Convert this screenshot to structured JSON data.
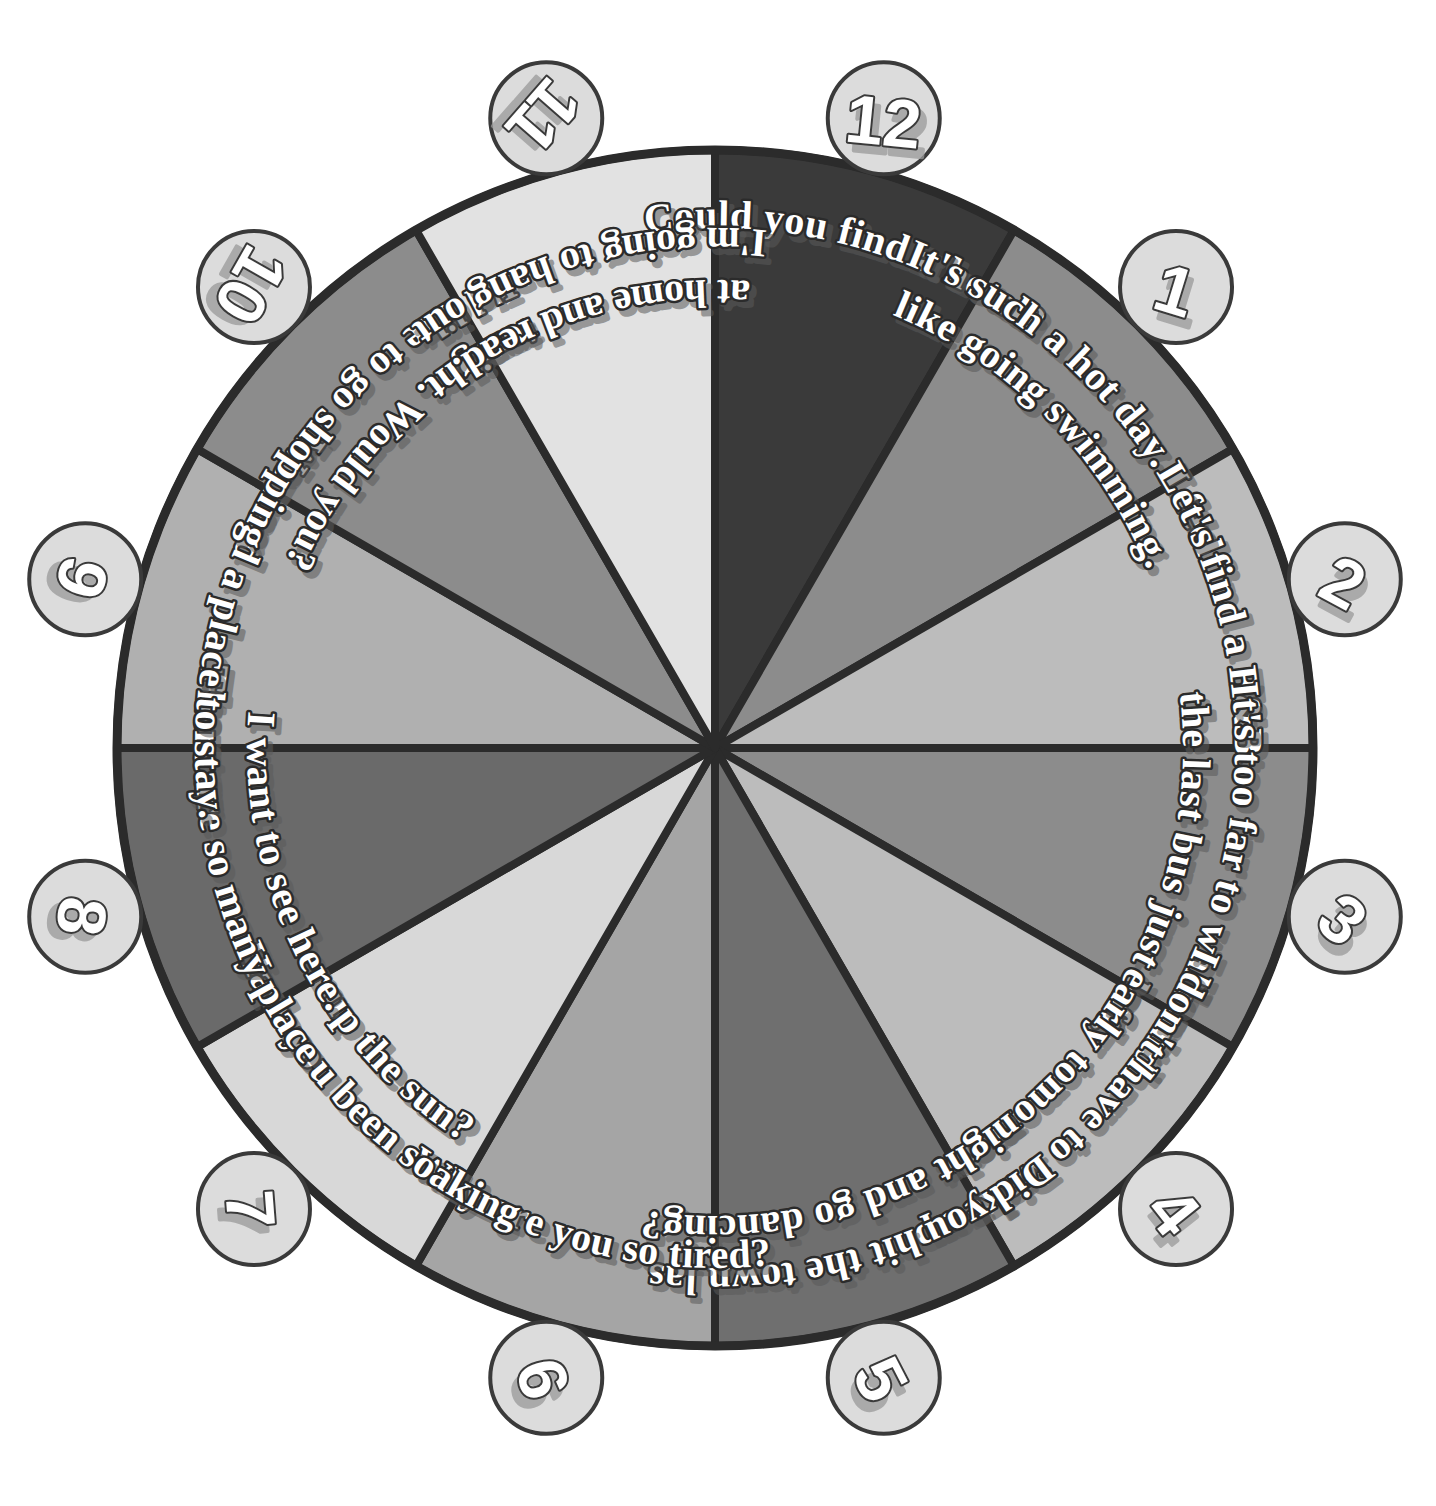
{
  "figure": {
    "name": "conversation-prompt-spinner-wheel",
    "type": "segmented-wheel",
    "background_color": "#ffffff",
    "outline_color": "#2b2b2b",
    "center": {
      "x": 715,
      "y": 748
    },
    "radius": 598,
    "segment_count": 12,
    "marker_radius": 56,
    "marker_fill": "#dcdcdc",
    "marker_stroke": "#3a3a3a",
    "marker_orbit_radius": 652,
    "text_fill": "#ffffff",
    "text_outline": "#2b2b2b"
  },
  "chart_data": {
    "type": "pie",
    "title": "",
    "categories": [
      "12",
      "1",
      "2",
      "3",
      "4",
      "5",
      "6",
      "7",
      "8",
      "9",
      "10",
      "11"
    ],
    "values": [
      30,
      30,
      30,
      30,
      30,
      30,
      30,
      30,
      30,
      30,
      30,
      30
    ],
    "legend_position": "outside-ring",
    "grid": false
  },
  "segments": [
    {
      "number": "12",
      "label": "Could you find a hotel?",
      "lines": [
        "Could you find a hotel?"
      ],
      "color": "#3a3a3a",
      "start_angle_deg": -90,
      "end_angle_deg": -60
    },
    {
      "number": "1",
      "label": "It's such a hot day. I feel like going swimming.",
      "lines": [
        "It's such a hot day. I feel",
        "like going swimming."
      ],
      "color": "#8c8c8c",
      "start_angle_deg": -60,
      "end_angle_deg": -30
    },
    {
      "number": "2",
      "label": "Let's find a B&B.",
      "lines": [
        "Let's find a B&B."
      ],
      "color": "#bcbcbc",
      "start_angle_deg": -30,
      "end_angle_deg": 0
    },
    {
      "number": "3",
      "label": "It's too far to walk and the last bus just left.",
      "lines": [
        "It's too far to walk and",
        "the last bus just left."
      ],
      "color": "#8c8c8c",
      "start_angle_deg": 0,
      "end_angle_deg": 30
    },
    {
      "number": "4",
      "label": "I don't have to wake up early tomorrow.",
      "lines": [
        "I don't have to wake up",
        "early tomorrow."
      ],
      "color": "#bcbcbc",
      "start_angle_deg": 30,
      "end_angle_deg": 60
    },
    {
      "number": "5",
      "label": "Did you hit the town last night and go dancing?",
      "lines": [
        "Did you hit the town last",
        "night and go dancing?"
      ],
      "color": "#6f6f6f",
      "start_angle_deg": 60,
      "end_angle_deg": 90
    },
    {
      "number": "6",
      "label": "Why are you so tired?",
      "lines": [
        "Why are you so tired?"
      ],
      "color": "#a5a5a5",
      "start_angle_deg": 90,
      "end_angle_deg": 120
    },
    {
      "number": "7",
      "label": "Have you been soaking up the sun?",
      "lines": [
        "Have you been soaking",
        "up the sun?"
      ],
      "color": "#d8d8d8",
      "start_angle_deg": 120,
      "end_angle_deg": 150
    },
    {
      "number": "8",
      "label": "There are so many places I want to see here.",
      "lines": [
        "There are so many places",
        "I want to see here."
      ],
      "color": "#6a6a6a",
      "start_angle_deg": 150,
      "end_angle_deg": 180
    },
    {
      "number": "9",
      "label": "We need a place to stay.",
      "lines": [
        "We need a place to stay."
      ],
      "color": "#b0b0b0",
      "start_angle_deg": 180,
      "end_angle_deg": 210
    },
    {
      "number": "10",
      "label": "I'd like to go shopping tonight. Would you?",
      "lines": [
        "I'd like to go shopping",
        "tonight. Would you?"
      ],
      "color": "#8c8c8c",
      "start_angle_deg": 210,
      "end_angle_deg": 240
    },
    {
      "number": "11",
      "label": "I'm going to hang out at home and read.",
      "lines": [
        "I'm going to hang out",
        "at home and read."
      ],
      "color": "#e2e2e2",
      "start_angle_deg": 240,
      "end_angle_deg": 270
    }
  ]
}
